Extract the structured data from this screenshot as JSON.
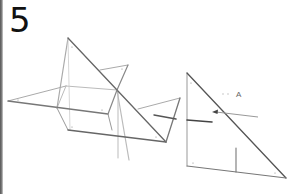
{
  "step": {
    "number": "5"
  },
  "diagram": {
    "label_a": "A",
    "colors": {
      "dark_line": "#555555",
      "light_line": "#aaaaaa",
      "background": "#ffffff",
      "text": "#111111"
    }
  }
}
